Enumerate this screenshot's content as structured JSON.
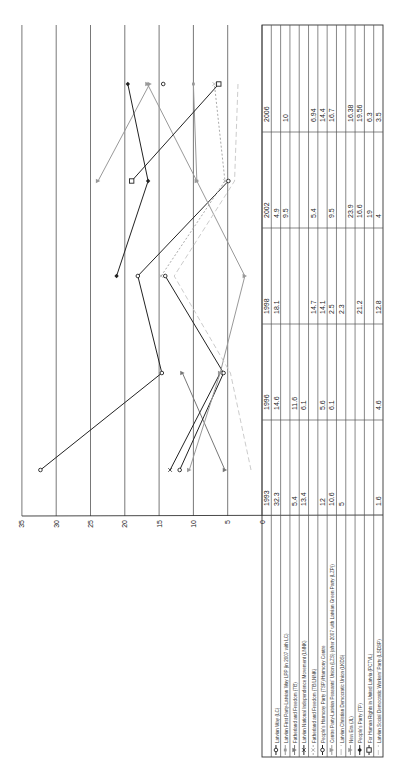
{
  "chart_data": {
    "type": "line",
    "title": "",
    "xlabel": "",
    "ylabel": "",
    "orientation": "rotated 90 degrees (years run bottom-to-top, values right-to-left)",
    "ylim": [
      0,
      35
    ],
    "yticks": [
      0,
      5,
      10,
      15,
      20,
      25,
      30,
      35
    ],
    "grid": true,
    "legend_position": "bottom (data table with legend)",
    "categories": [
      "1993",
      "1996",
      "1998",
      "2002",
      "2006"
    ],
    "series": [
      {
        "name": "Latvian Way (LC)",
        "marker": "circle",
        "color": "#222222",
        "dash": "",
        "values": [
          32.3,
          14.6,
          18.1,
          4.9,
          null
        ]
      },
      {
        "name": "Latvian First Party-Latvian Way LPP (in 2007 with LC)",
        "marker": "square-small",
        "color": "#999999",
        "dash": "",
        "values": [
          null,
          null,
          null,
          9.5,
          10
        ]
      },
      {
        "name": "Fatherland and Freedom (TB)",
        "marker": "triangle",
        "color": "#777777",
        "dash": "",
        "values": [
          5.4,
          11.6,
          null,
          null,
          null
        ]
      },
      {
        "name": "Latvian National Independence Movement (LNNK)",
        "marker": "x",
        "color": "#222222",
        "dash": "",
        "values": [
          13.4,
          6.1,
          null,
          null,
          null
        ]
      },
      {
        "name": "Fatherland and Freedom (TB/LNNK)",
        "marker": "x",
        "color": "#aaaaaa",
        "dash": "2,2",
        "values": [
          null,
          null,
          14.7,
          5.4,
          6.94
        ]
      },
      {
        "name": "People's Harmony Party (TSP)/Harmony Centre",
        "marker": "circle",
        "color": "#222222",
        "dash": "",
        "values": [
          12,
          5.6,
          14.1,
          null,
          14.4
        ]
      },
      {
        "name": "Centre Party-Latvian Peasants' Union (LZS) (after 2007 with Latvian Green Party (LZP))",
        "marker": "triangle",
        "color": "#999999",
        "dash": "",
        "values": [
          10.6,
          6.1,
          2.5,
          9.5,
          16.7
        ]
      },
      {
        "name": "Latvian Christian Democratic Union (LKDS)",
        "marker": "none",
        "color": "#bbbbbb",
        "dash": "6,3",
        "values": [
          5,
          null,
          2.3,
          null,
          null
        ]
      },
      {
        "name": "New Era (JL)",
        "marker": "triangle",
        "color": "#999999",
        "dash": "",
        "values": [
          null,
          null,
          null,
          23.9,
          16.38
        ]
      },
      {
        "name": "People's Party (TP)",
        "marker": "diamond",
        "color": "#222222",
        "dash": "",
        "values": [
          null,
          null,
          21.2,
          16.6,
          19.56
        ]
      },
      {
        "name": "For Human Rights in United Latvia (PCTVL)",
        "marker": "square",
        "color": "#222222",
        "dash": "",
        "values": [
          null,
          null,
          null,
          19,
          6.3
        ]
      },
      {
        "name": "Latvian Social Democratic Workers' Party (LSDSP)",
        "marker": "none",
        "color": "#cccccc",
        "dash": "5,3",
        "values": [
          1.6,
          4.6,
          12.8,
          4,
          3.5
        ]
      }
    ]
  },
  "table": {
    "years": [
      "1993",
      "1996",
      "1998",
      "2002",
      "2006"
    ],
    "rows": [
      {
        "label": "Latvian Way (LC)",
        "cells": [
          "32.3",
          "14.6",
          "18.1",
          "4.9",
          ""
        ]
      },
      {
        "label": "Latvian First Party-Latvian Way LPP (in 2007 with LC)",
        "cells": [
          "",
          "",
          "",
          "9.5",
          "10"
        ]
      },
      {
        "label": "Fatherland and Freedom (TB)",
        "cells": [
          "5.4",
          "11.6",
          "",
          "",
          ""
        ]
      },
      {
        "label": "Latvian National Independence Movement (LNNK)",
        "cells": [
          "13.4",
          "6.1",
          "",
          "",
          ""
        ]
      },
      {
        "label": "Fatherland and Freedom (TB/LNNK)",
        "cells": [
          "",
          "",
          "14.7",
          "5.4",
          "6.94"
        ]
      },
      {
        "label": "People's Harmony Party (TSP)/Harmony Centre",
        "cells": [
          "12",
          "5.6",
          "14.1",
          "",
          "14.4"
        ]
      },
      {
        "label": "Centre Party-Latvian Peasants' Union (LZS) (after 2007 with Latvian Green Party (LZP))",
        "cells": [
          "10.6",
          "6.1",
          "2.5",
          "9.5",
          "16.7"
        ]
      },
      {
        "label": "Latvian Christian Democratic Union (LKDS)",
        "cells": [
          "5",
          "",
          "2.3",
          "",
          ""
        ]
      },
      {
        "label": "New Era (JL)",
        "cells": [
          "",
          "",
          "",
          "23.9",
          "16.38"
        ]
      },
      {
        "label": "People's Party (TP)",
        "cells": [
          "",
          "",
          "21.2",
          "16.6",
          "19.56"
        ]
      },
      {
        "label": "For Human Rights in United Latvia (PCTVL)",
        "cells": [
          "",
          "",
          "",
          "19",
          "6.3"
        ]
      },
      {
        "label": "Latvian Social Democratic Workers' Party (LSDSP)",
        "cells": [
          "1.6",
          "4.6",
          "12.8",
          "4",
          "3.5"
        ]
      }
    ]
  }
}
